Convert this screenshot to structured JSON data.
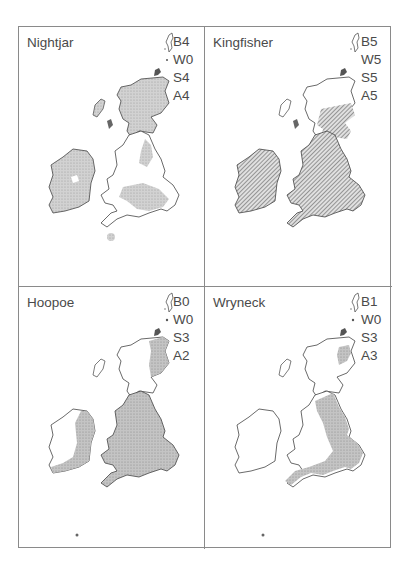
{
  "figure": {
    "layout": "2x2 grid of distribution maps of Britain and Ireland",
    "colors": {
      "frame": "#8a8a8a",
      "coast_outline": "#444444",
      "stipple_fill": "#c8c8c8",
      "hatch_fill": "#555555",
      "background": "#ffffff"
    },
    "legend_keys": [
      "B",
      "W",
      "S",
      "A"
    ],
    "panels": [
      {
        "species": "Nightjar",
        "codes": [
          "B4",
          "W0",
          "S4",
          "A4"
        ],
        "fill_style": "stipple",
        "distribution": "patchy across Scotland, Ireland, northern and southern England and Wales"
      },
      {
        "species": "Kingfisher",
        "codes": [
          "B5",
          "W5",
          "S5",
          "A5"
        ],
        "fill_style": "hatch",
        "distribution": "widespread across Ireland, Wales, England and southern/central Scotland"
      },
      {
        "species": "Hoopoe",
        "codes": [
          "B0",
          "W0",
          "S3",
          "A2"
        ],
        "fill_style": "stipple",
        "distribution": "eastern Scotland coast, most of England and Wales, east and south coast of Ireland"
      },
      {
        "species": "Wryneck",
        "codes": [
          "B1",
          "W0",
          "S3",
          "A3"
        ],
        "fill_style": "stipple",
        "distribution": "eastern coastal strip of Scotland and England, south-east and south England"
      }
    ]
  }
}
